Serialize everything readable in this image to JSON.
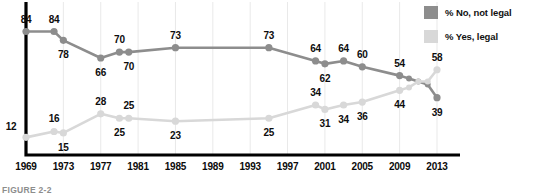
{
  "caption": "FIGURE 2-2",
  "colors": {
    "series_no": "#8d8d8d",
    "series_yes": "#d8d8d8",
    "axis": "#000000",
    "gridline": "#e9e9e9",
    "label_text": "#0d0d0d"
  },
  "legend": {
    "position": "top-right",
    "items": [
      {
        "label": "% No, not legal",
        "color": "#8d8d8d",
        "swatch": "legend-swatch-no"
      },
      {
        "label": "% Yes, legal",
        "color": "#d8d8d8",
        "swatch": "legend-swatch-yes"
      }
    ]
  },
  "axis": {
    "ticks": [
      "1969",
      "1973",
      "1977",
      "1981",
      "1985",
      "1989",
      "1993",
      "1997",
      "2001",
      "2005",
      "2009",
      "2013"
    ]
  },
  "chart_data": {
    "type": "line",
    "title": "",
    "subtitle": "",
    "xlabel": "",
    "ylabel": "",
    "xlim": [
      1969,
      2013
    ],
    "ylim": [
      0,
      100
    ],
    "grid": true,
    "legend_position": "top-right",
    "x_tick_labels": [
      "1969",
      "1973",
      "1977",
      "1981",
      "1985",
      "1989",
      "1993",
      "1997",
      "2001",
      "2005",
      "2009",
      "2013"
    ],
    "x_ticks": [
      1969,
      1973,
      1977,
      1981,
      1985,
      1989,
      1993,
      1997,
      2001,
      2005,
      2009,
      2013
    ],
    "series": [
      {
        "name": "% No, not legal",
        "color": "#8d8d8d",
        "x": [
          1969,
          1972,
          1973,
          1977,
          1979,
          1980,
          1985,
          1995,
          2000,
          2001,
          2003,
          2005,
          2009,
          2010,
          2011,
          2012,
          2013
        ],
        "values": [
          84,
          84,
          78,
          66,
          70,
          70,
          73,
          73,
          64,
          62,
          64,
          60,
          54,
          52,
          50,
          48,
          39
        ],
        "labeled_points": [
          {
            "x": 1969,
            "value": 84,
            "label": "84",
            "label_pos": "above"
          },
          {
            "x": 1972,
            "value": 84,
            "label": "84",
            "label_pos": "above"
          },
          {
            "x": 1973,
            "value": 78,
            "label": "78",
            "label_pos": "below"
          },
          {
            "x": 1977,
            "value": 66,
            "label": "66",
            "label_pos": "below"
          },
          {
            "x": 1979,
            "value": 70,
            "label": "70",
            "label_pos": "above"
          },
          {
            "x": 1980,
            "value": 70,
            "label": "70",
            "label_pos": "below"
          },
          {
            "x": 1985,
            "value": 73,
            "label": "73",
            "label_pos": "above"
          },
          {
            "x": 1995,
            "value": 73,
            "label": "73",
            "label_pos": "above"
          },
          {
            "x": 2000,
            "value": 64,
            "label": "64",
            "label_pos": "above"
          },
          {
            "x": 2001,
            "value": 62,
            "label": "62",
            "label_pos": "below"
          },
          {
            "x": 2003,
            "value": 64,
            "label": "64",
            "label_pos": "above"
          },
          {
            "x": 2005,
            "value": 60,
            "label": "60",
            "label_pos": "above"
          },
          {
            "x": 2009,
            "value": 54,
            "label": "54",
            "label_pos": "above"
          },
          {
            "x": 2013,
            "value": 39,
            "label": "39",
            "label_pos": "below"
          }
        ]
      },
      {
        "name": "% Yes, legal",
        "color": "#d8d8d8",
        "x": [
          1969,
          1972,
          1973,
          1977,
          1979,
          1980,
          1985,
          1995,
          2000,
          2001,
          2003,
          2005,
          2009,
          2010,
          2011,
          2012,
          2013
        ],
        "values": [
          12,
          16,
          15,
          28,
          25,
          25,
          23,
          25,
          34,
          31,
          34,
          36,
          44,
          46,
          50,
          50,
          58
        ],
        "labeled_points": [
          {
            "x": 1969,
            "value": 12,
            "label": "12",
            "label_pos": "left"
          },
          {
            "x": 1972,
            "value": 16,
            "label": "16",
            "label_pos": "above"
          },
          {
            "x": 1973,
            "value": 15,
            "label": "15",
            "label_pos": "below"
          },
          {
            "x": 1977,
            "value": 28,
            "label": "28",
            "label_pos": "above"
          },
          {
            "x": 1979,
            "value": 25,
            "label": "25",
            "label_pos": "below"
          },
          {
            "x": 1980,
            "value": 25,
            "label": "25",
            "label_pos": "above"
          },
          {
            "x": 1985,
            "value": 23,
            "label": "23",
            "label_pos": "below"
          },
          {
            "x": 1995,
            "value": 25,
            "label": "25",
            "label_pos": "below"
          },
          {
            "x": 2000,
            "value": 34,
            "label": "34",
            "label_pos": "above"
          },
          {
            "x": 2001,
            "value": 31,
            "label": "31",
            "label_pos": "below"
          },
          {
            "x": 2003,
            "value": 34,
            "label": "34",
            "label_pos": "below"
          },
          {
            "x": 2005,
            "value": 36,
            "label": "36",
            "label_pos": "below"
          },
          {
            "x": 2009,
            "value": 44,
            "label": "44",
            "label_pos": "below"
          },
          {
            "x": 2013,
            "value": 58,
            "label": "58",
            "label_pos": "above"
          }
        ]
      }
    ]
  }
}
